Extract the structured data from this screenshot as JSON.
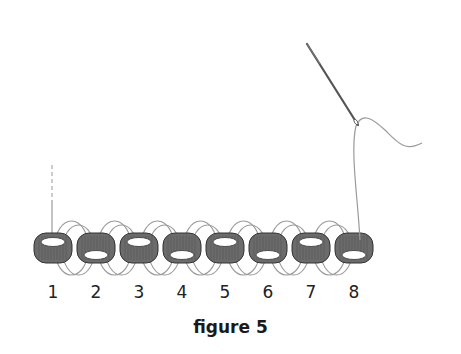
{
  "figure": {
    "caption": "figure 5",
    "bead_color": "#6b6b6b",
    "thread_color": "#9a9a9a",
    "needle_color": "#555555",
    "beads": [
      {
        "label": "1",
        "hole": "top"
      },
      {
        "label": "2",
        "hole": "bottom"
      },
      {
        "label": "3",
        "hole": "top"
      },
      {
        "label": "4",
        "hole": "bottom"
      },
      {
        "label": "5",
        "hole": "top"
      },
      {
        "label": "6",
        "hole": "bottom"
      },
      {
        "label": "7",
        "hole": "top"
      },
      {
        "label": "8",
        "hole": "bottom"
      }
    ]
  }
}
